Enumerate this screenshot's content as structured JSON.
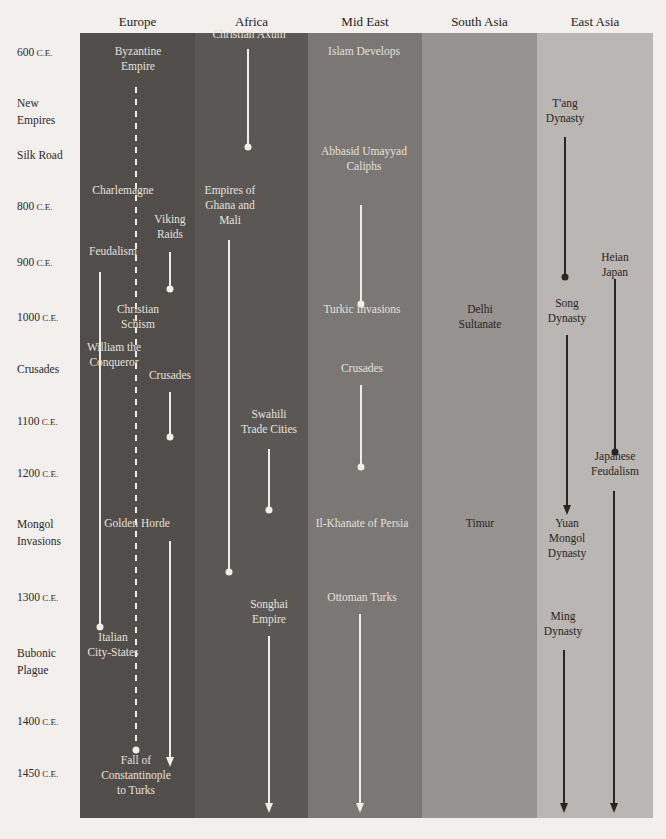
{
  "columns": [
    {
      "name": "Europe",
      "x": 80,
      "w": 115,
      "color": "#504d4a"
    },
    {
      "name": "Africa",
      "x": 195,
      "w": 113,
      "color": "#5a5754"
    },
    {
      "name": "Mid East",
      "x": 308,
      "w": 114,
      "color": "#7a7774"
    },
    {
      "name": "South Asia",
      "x": 422,
      "w": 115,
      "color": "#969390"
    },
    {
      "name": "East Asia",
      "x": 537,
      "w": 116,
      "color": "#b9b6b3"
    }
  ],
  "eras": [
    {
      "label": "600",
      "suffix": "C.E.",
      "y": 52
    },
    {
      "label": "New\nEmpires",
      "suffix": "",
      "y": 103
    },
    {
      "label": "Silk Road",
      "suffix": "",
      "y": 155
    },
    {
      "label": "800",
      "suffix": "C.E.",
      "y": 206
    },
    {
      "label": "900",
      "suffix": "C.E.",
      "y": 262
    },
    {
      "label": "1000",
      "suffix": "C.E.",
      "y": 317
    },
    {
      "label": "Crusades",
      "suffix": "",
      "y": 369
    },
    {
      "label": "1100",
      "suffix": "C.E.",
      "y": 421
    },
    {
      "label": "1200",
      "suffix": "C.E.",
      "y": 473
    },
    {
      "label": "Mongol\nInvasions",
      "suffix": "",
      "y": 524
    },
    {
      "label": "1300",
      "suffix": "C.E.",
      "y": 597
    },
    {
      "label": "Bubonic\nPlague",
      "suffix": "",
      "y": 653
    },
    {
      "label": "1400",
      "suffix": "C.E.",
      "y": 721
    },
    {
      "label": "1450",
      "suffix": "C.E.",
      "y": 773
    }
  ],
  "events": [
    {
      "text": "Byzantine\nEmpire",
      "x": 138,
      "y": 52,
      "tone": "light"
    },
    {
      "text": "Charlemagne",
      "x": 123,
      "y": 191,
      "tone": "light"
    },
    {
      "text": "Viking\nRaids",
      "x": 170,
      "y": 220,
      "tone": "light"
    },
    {
      "text": "Feudalism",
      "x": 113,
      "y": 252,
      "tone": "light"
    },
    {
      "text": "Christian\nSchism",
      "x": 138,
      "y": 310,
      "tone": "light"
    },
    {
      "text": "William the\nConqueror",
      "x": 114,
      "y": 348,
      "tone": "light"
    },
    {
      "text": "Crusades",
      "x": 170,
      "y": 376,
      "tone": "light"
    },
    {
      "text": "Golden Horde",
      "x": 137,
      "y": 524,
      "tone": "light"
    },
    {
      "text": "Italian\nCity-States",
      "x": 113,
      "y": 638,
      "tone": "light"
    },
    {
      "text": "Fall of\nConstantinople\nto Turks",
      "x": 136,
      "y": 761,
      "tone": "light"
    },
    {
      "text": "Christian Axum",
      "x": 249,
      "y": 35,
      "tone": "light"
    },
    {
      "text": "Empires of\nGhana and\nMali",
      "x": 230,
      "y": 191,
      "tone": "light"
    },
    {
      "text": "Swahili\nTrade Cities",
      "x": 269,
      "y": 415,
      "tone": "light"
    },
    {
      "text": "Songhai\nEmpire",
      "x": 269,
      "y": 605,
      "tone": "light"
    },
    {
      "text": "Islam Develops",
      "x": 364,
      "y": 52,
      "tone": "light"
    },
    {
      "text": "Abbasid Umayyad\nCaliphs",
      "x": 364,
      "y": 152,
      "tone": "light"
    },
    {
      "text": "Turkic Invasions",
      "x": 362,
      "y": 310,
      "tone": "light"
    },
    {
      "text": "Crusades",
      "x": 362,
      "y": 369,
      "tone": "light"
    },
    {
      "text": "Il-Khanate of Persia",
      "x": 362,
      "y": 524,
      "tone": "light"
    },
    {
      "text": "Ottoman Turks",
      "x": 362,
      "y": 598,
      "tone": "light"
    },
    {
      "text": "Delhi\nSultanate",
      "x": 480,
      "y": 310,
      "tone": "dark"
    },
    {
      "text": "Timur",
      "x": 480,
      "y": 524,
      "tone": "dark"
    },
    {
      "text": "T'ang\nDynasty",
      "x": 565,
      "y": 104,
      "tone": "dark"
    },
    {
      "text": "Heian Japan",
      "x": 615,
      "y": 258,
      "tone": "dark"
    },
    {
      "text": "Song\nDynasty",
      "x": 567,
      "y": 304,
      "tone": "dark"
    },
    {
      "text": "Japanese\nFeudalism",
      "x": 615,
      "y": 457,
      "tone": "dark"
    },
    {
      "text": "Yuan\nMongol\nDynasty",
      "x": 567,
      "y": 524,
      "tone": "dark"
    },
    {
      "text": "Ming\nDynasty",
      "x": 563,
      "y": 617,
      "tone": "dark"
    }
  ],
  "lines": [
    {
      "x": 136,
      "y1": 87,
      "y2": 750,
      "end": "dot",
      "style": "dashed",
      "color": "#f0ede8"
    },
    {
      "x": 170,
      "y1": 252,
      "y2": 289,
      "end": "dot",
      "style": "solid",
      "color": "#f0ede8"
    },
    {
      "x": 100,
      "y1": 272,
      "y2": 627,
      "end": "dot",
      "style": "solid",
      "color": "#f0ede8"
    },
    {
      "x": 170,
      "y1": 392,
      "y2": 437,
      "end": "dot",
      "style": "solid",
      "color": "#f0ede8"
    },
    {
      "x": 170,
      "y1": 541,
      "y2": 767,
      "end": "arrow",
      "style": "solid",
      "color": "#f0ede8"
    },
    {
      "x": 248,
      "y1": 49,
      "y2": 147,
      "end": "dot",
      "style": "solid",
      "color": "#f0ede8"
    },
    {
      "x": 229,
      "y1": 240,
      "y2": 572,
      "end": "dot",
      "style": "solid",
      "color": "#f0ede8"
    },
    {
      "x": 269,
      "y1": 449,
      "y2": 510,
      "end": "dot",
      "style": "solid",
      "color": "#f0ede8"
    },
    {
      "x": 269,
      "y1": 636,
      "y2": 813,
      "end": "arrow",
      "style": "solid",
      "color": "#f0ede8"
    },
    {
      "x": 361,
      "y1": 205,
      "y2": 304,
      "end": "dot",
      "style": "solid",
      "color": "#f0ede8"
    },
    {
      "x": 361,
      "y1": 385,
      "y2": 467,
      "end": "dot",
      "style": "solid",
      "color": "#f0ede8"
    },
    {
      "x": 360,
      "y1": 614,
      "y2": 813,
      "end": "arrow",
      "style": "solid",
      "color": "#f0ede8"
    },
    {
      "x": 565,
      "y1": 137,
      "y2": 277,
      "end": "dot",
      "style": "solid",
      "color": "#2a2520"
    },
    {
      "x": 615,
      "y1": 279,
      "y2": 452,
      "end": "dot",
      "style": "solid",
      "color": "#2a2520"
    },
    {
      "x": 567,
      "y1": 335,
      "y2": 515,
      "end": "arrow",
      "style": "solid",
      "color": "#2a2520"
    },
    {
      "x": 614,
      "y1": 491,
      "y2": 813,
      "end": "arrow",
      "style": "solid",
      "color": "#2a2520"
    },
    {
      "x": 564,
      "y1": 650,
      "y2": 813,
      "end": "arrow",
      "style": "solid",
      "color": "#2a2520"
    }
  ]
}
